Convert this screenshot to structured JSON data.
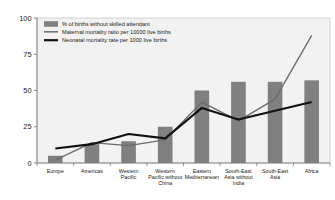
{
  "chart_data": {
    "type": "bar",
    "title": "",
    "xlabel": "",
    "ylabel": "",
    "ylim": [
      0,
      100
    ],
    "yticks": [
      0,
      25,
      50,
      75,
      100
    ],
    "grid": false,
    "legend_position": "top-left",
    "categories": [
      "Europe",
      "Americas",
      "Western Pacific",
      "Western Pacific without China",
      "Eastern Mediterranean",
      "South-East Asia without India",
      "South-East Asia",
      "Africa"
    ],
    "series": [
      {
        "name": "% of births without skilled attendant",
        "type": "bar",
        "color": "#808080",
        "values": [
          5,
          13,
          15,
          25,
          50,
          56,
          56,
          57
        ]
      },
      {
        "name": "Maternal mortality ratio per 10000 live births",
        "type": "line",
        "color": "#6b6b6b",
        "values": [
          2,
          14,
          12,
          16,
          42,
          29,
          44,
          88
        ]
      },
      {
        "name": "Neonatal mortality rate per 1000 live births",
        "type": "line",
        "color": "#111111",
        "values": [
          10,
          13,
          20,
          17,
          38,
          30,
          36,
          42
        ]
      }
    ]
  },
  "axis": {
    "tick_labels": [
      "100",
      "75",
      "50",
      "25",
      "0"
    ]
  },
  "legend": {
    "items": [
      {
        "label": "% of births without skilled attendant",
        "marker": "swatch",
        "color": "#808080"
      },
      {
        "label": "Maternal mortality ratio per 10000 live births",
        "marker": "line-thin",
        "color": "#6b6b6b"
      },
      {
        "label": "Neonatal mortality rate per 1000 live births",
        "marker": "line-thick",
        "color": "#111111"
      }
    ]
  },
  "category_label_lines": [
    [
      "Europe"
    ],
    [
      "Americas"
    ],
    [
      "Western",
      "Pacific"
    ],
    [
      "Western",
      "Pacific without",
      "China"
    ],
    [
      "Eastern",
      "Mediterranean"
    ],
    [
      "South-East",
      "Asia without",
      "India"
    ],
    [
      "South-East",
      "Asia"
    ],
    [
      "Africa"
    ]
  ],
  "colors": {
    "bar": "#808080",
    "maternal_line": "#6b6b6b",
    "neonatal_line": "#111111",
    "plot_background": "#f2f2f2",
    "axis": "#6f6f6f",
    "page_background": "#ffffff"
  }
}
